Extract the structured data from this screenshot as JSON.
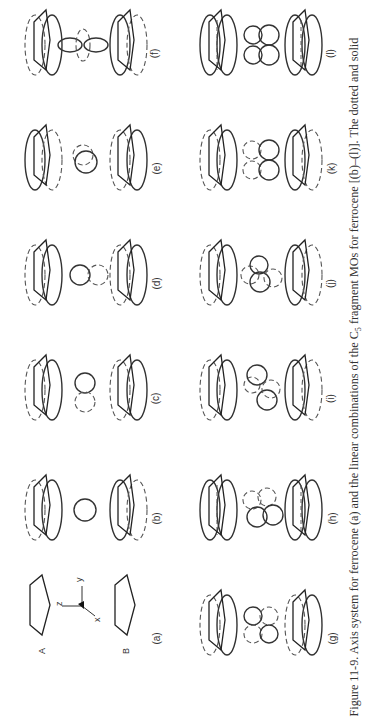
{
  "figure": {
    "number": "Figure 11-9.",
    "caption_parts": {
      "prefix": "Figure 11-9.  Axis system for ferrocene (a) and the linear combinations of the C",
      "subscript": "5",
      "suffix": " fragment MOs for ferrocene [(b)–(l)]. The dotted and solid"
    },
    "orientation": "rotated 90° counter-clockwise",
    "panels": [
      {
        "id": "a",
        "label": "(a)",
        "content": "axis-system",
        "ring_labels": [
          "A",
          "B"
        ],
        "axes": [
          "z",
          "y",
          "x"
        ]
      },
      {
        "id": "b",
        "label": "(b)",
        "content": "metal-s-orbital"
      },
      {
        "id": "c",
        "label": "(c)",
        "content": "metal-p-orbital"
      },
      {
        "id": "d",
        "label": "(d)",
        "content": "metal-p-orbital"
      },
      {
        "id": "e",
        "label": "(e)",
        "content": "metal-p-orbital-end-on"
      },
      {
        "id": "f",
        "label": "(f)",
        "content": "metal-dz2-orbital"
      },
      {
        "id": "g",
        "label": "(g)",
        "content": "metal-d-orbital-four-lobe"
      },
      {
        "id": "h",
        "label": "(h)",
        "content": "metal-d-orbital-four-lobe"
      },
      {
        "id": "i",
        "label": "(i)",
        "content": "metal-d-orbital-tilted"
      },
      {
        "id": "j",
        "label": "(j)",
        "content": "metal-d-orbital-tilted"
      },
      {
        "id": "k",
        "label": "(k)",
        "content": "metal-d-orbital-four-lobe"
      },
      {
        "id": "l",
        "label": "(l)",
        "content": "metal-d-orbital-four-lobe"
      }
    ]
  }
}
